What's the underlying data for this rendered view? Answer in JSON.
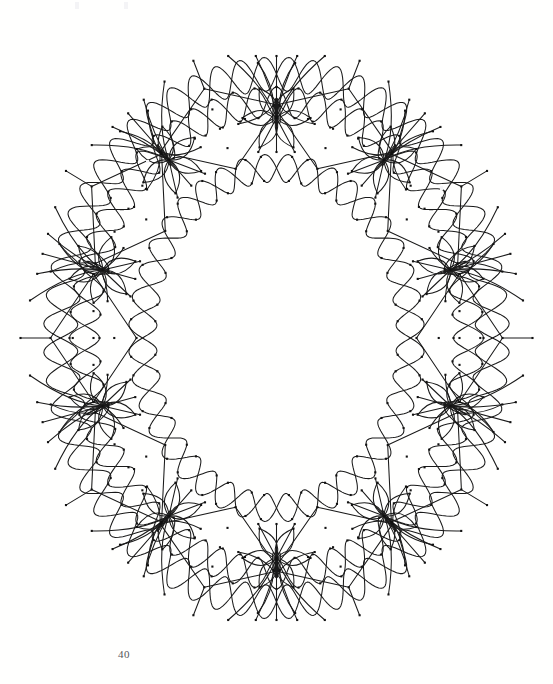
{
  "page": {
    "folio": "40",
    "background_color": "#ffffff",
    "ink_color": "#1a1a1a",
    "folio_color": "#55565a",
    "width": 553,
    "height": 684
  },
  "artwork": {
    "title": "Oval kolam wreath",
    "type": "line-drawing",
    "stroke_color": "#1a1a1a",
    "stroke_width": 1.05,
    "dot_color": "#111111",
    "dot_size": 2.1,
    "center": {
      "cx": 276.5,
      "cy": 338
    },
    "ring": {
      "modules": 10,
      "diamond_ring_rx": 183,
      "diamond_ring_ry": 220,
      "rosette_ring_rx": 183,
      "rosette_ring_ry": 220,
      "inner_void_rx": 108,
      "inner_void_ry": 140,
      "outer_band_rx": 246,
      "outer_band_ry": 300
    },
    "diamond": {
      "count": 10,
      "half_width": 64,
      "half_height": 43,
      "interior_dots": 5,
      "interior_dot_layout": "quincunx",
      "corner_dots": 4
    },
    "rosette": {
      "count": 10,
      "petals": 6,
      "petal_length": 34,
      "petal_width": 15
    },
    "scallop_band": {
      "loops_per_module": 3,
      "rows": 2
    }
  }
}
